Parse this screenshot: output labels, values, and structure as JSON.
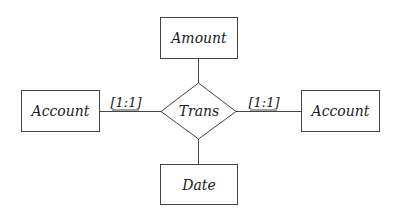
{
  "diagram": {
    "type": "er-diagram",
    "relationship": {
      "label": "Trans",
      "shape": "diamond"
    },
    "entities": {
      "top": {
        "label": "Amount"
      },
      "left": {
        "label": "Account"
      },
      "right": {
        "label": "Account"
      },
      "bottom": {
        "label": "Date"
      }
    },
    "cardinalities": {
      "left": "[1:1]",
      "right": "[1:1]"
    },
    "colors": {
      "stroke": "#444444",
      "text": "#1a1a1a",
      "background": "#ffffff"
    }
  }
}
